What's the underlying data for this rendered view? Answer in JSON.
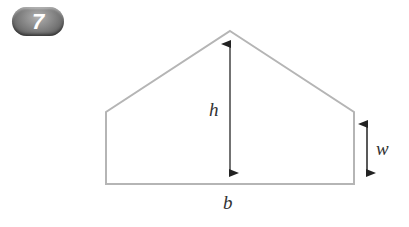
{
  "badge": {
    "number": "7"
  },
  "diagram": {
    "shape": "pentagon (rectangle with triangular roof)",
    "labels": {
      "height": "h",
      "width_side": "w",
      "base": "b"
    },
    "colors": {
      "outline": "#b5b5b5",
      "arrows": "#222222",
      "badge": "#7a7a7a"
    }
  }
}
